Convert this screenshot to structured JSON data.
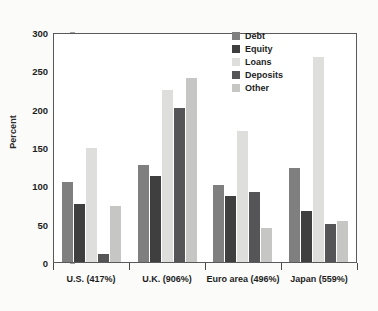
{
  "chart_data": {
    "type": "bar",
    "title": "",
    "xlabel": "",
    "ylabel": "Percent",
    "ylim": [
      0,
      300
    ],
    "yticks": [
      0,
      50,
      100,
      150,
      200,
      250,
      300
    ],
    "grid": false,
    "legend_position": "top-right",
    "categories": [
      "U.S. (417%)",
      "U.K. (906%)",
      "Euro area (496%)",
      "Japan (559%)"
    ],
    "series": [
      {
        "name": "Debt",
        "color": "#7f7f7f",
        "values": [
          105,
          127,
          100,
          123
        ]
      },
      {
        "name": "Equity",
        "color": "#3f3f3f",
        "values": [
          76,
          112,
          86,
          66
        ]
      },
      {
        "name": "Loans",
        "color": "#dededc",
        "values": [
          149,
          225,
          171,
          267
        ]
      },
      {
        "name": "Deposits",
        "color": "#555557",
        "values": [
          10,
          201,
          91,
          49
        ]
      },
      {
        "name": "Other",
        "color": "#c6c6c4",
        "values": [
          73,
          240,
          45,
          54
        ]
      }
    ]
  }
}
